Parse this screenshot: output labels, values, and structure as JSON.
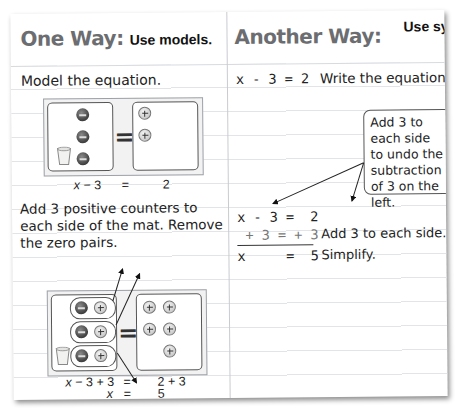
{
  "left": {
    "heading_big": "One Way:",
    "heading_small": "Use models.",
    "step1": "Model the equation.",
    "mat1": {
      "left_counters": [
        "negative",
        "negative",
        "negative"
      ],
      "right_counters": [
        "positive",
        "positive"
      ],
      "equals": "=",
      "caption_left": "x − 3",
      "caption_eq": "=",
      "caption_right": "2"
    },
    "step2": "Add 3 positive counters to each side of the mat. Remove the zero pairs.",
    "mat2": {
      "zero_pairs": 3,
      "right_counters": 5,
      "equals": "=",
      "caption1_left": "x − 3 + 3",
      "caption1_eq": "=",
      "caption1_right": "2 + 3",
      "caption2_left": "x",
      "caption2_eq": "=",
      "caption2_right": "5"
    }
  },
  "right": {
    "heading_big": "Another Way:",
    "heading_small": "Use symbols.",
    "eq1": "x - 3 = 2",
    "eq1_note": "Write the equation.",
    "callout": "Add 3 to each side to undo the subtraction of 3 on the left.",
    "line1": "x - 3 =  2",
    "line2": " + 3 = + 3",
    "line2_note": "Add 3 to each side.",
    "line3": "x     =  5",
    "line3_note": "Simplify."
  },
  "colors": {
    "heading_grey": "#6b6d70",
    "rule_line": "#e2e4e8",
    "divider": "#c9cbcf",
    "negative_counter": "#4a4a4a",
    "positive_counter": "#d6d6d6"
  }
}
